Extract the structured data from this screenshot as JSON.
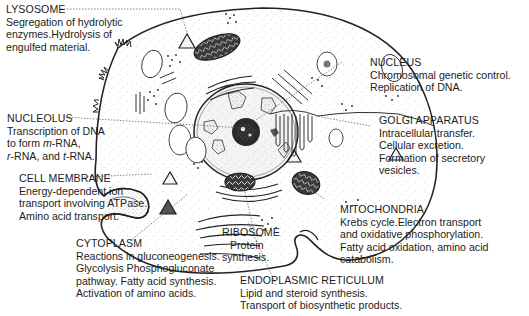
{
  "diagram": {
    "labels": {
      "lysosome": {
        "title": "LYSOSOME",
        "lines": [
          "Segregation of hydrolytic",
          "enzymes.Hydrolysis of",
          "engulfed material."
        ]
      },
      "nucleus": {
        "title": "NUCLEUS",
        "lines": [
          "Chromosomal genetic control.",
          "Replication of DNA."
        ]
      },
      "nucleolus": {
        "title": "NUCLEOLUS",
        "lines": [
          "Transcription of DNA",
          "to form m-RNA,",
          "r-RNA, and t-RNA."
        ],
        "italic_prefixes": [
          "m",
          "r",
          "t"
        ]
      },
      "golgi_apparatus": {
        "title": "GOLGI APPARATUS",
        "lines": [
          "Intracellular transfer.",
          "Cellular excretion.",
          "Formation of secretory",
          "vesicles."
        ]
      },
      "cell_membrane": {
        "title": "CELL MEMBRANE",
        "lines": [
          "Energy-dependent ion",
          "transport involving ATPase.",
          "Amino acid transport."
        ]
      },
      "mitochondria": {
        "title": "MITOCHONDRIA",
        "lines": [
          "Krebs cycle.Electron transport",
          "and oxidative phosphorylation.",
          "Fatty acid oxidation, amino acid",
          "catabolism."
        ]
      },
      "ribosome": {
        "title": "RIBOSOME",
        "lines": [
          "Protein",
          "synthesis."
        ]
      },
      "cytoplasm": {
        "title": "CYTOPLASM",
        "lines": [
          "Reactions in gluconeogenesis.",
          "Glycolysis Phosphogluconate",
          "pathway. Fatty acid synthesis.",
          "Activation of amino acids."
        ]
      },
      "endoplasmic_reticulum": {
        "title": "ENDOPLASMIC RETICULUM",
        "lines": [
          "Lipid and steroid synthesis.",
          "Transport of biosynthetic products."
        ]
      }
    },
    "colors": {
      "ink": "#1c1c1c",
      "stipple": "#8a8a8a",
      "background": "#ffffff"
    }
  }
}
